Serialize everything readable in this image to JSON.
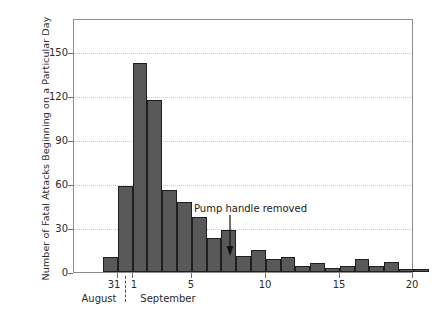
{
  "chart_data": {
    "type": "bar",
    "title": "",
    "xlabel": "",
    "ylabel": "Number of Fatal Attacks Beginning on a Particular Day",
    "ylim": [
      0,
      160
    ],
    "yticks": [
      0,
      30,
      60,
      90,
      120,
      150
    ],
    "ytick_labels": [
      "0",
      "30",
      "60",
      "90",
      "120",
      "150"
    ],
    "xlim": [
      29,
      21
    ],
    "xticks": [
      31,
      1,
      5,
      10,
      15,
      20
    ],
    "xtick_labels": [
      "31",
      "1",
      "5",
      "10",
      "15",
      "20"
    ],
    "grid": true,
    "legend": null,
    "bar_color": "#595959",
    "bar_edge_color": "#1f1f1f",
    "categories": [
      "Aug 30",
      "Aug 31",
      "Sep 1",
      "Sep 2",
      "Sep 3",
      "Sep 4",
      "Sep 5",
      "Sep 6",
      "Sep 7",
      "Sep 8",
      "Sep 9",
      "Sep 10",
      "Sep 11",
      "Sep 12",
      "Sep 13",
      "Sep 14",
      "Sep 15",
      "Sep 16",
      "Sep 17",
      "Sep 18",
      "Sep 19",
      "Sep 20"
    ],
    "values": [
      10,
      59,
      143,
      118,
      56,
      48,
      38,
      23,
      29,
      11,
      15,
      9,
      10,
      4,
      6,
      3,
      4,
      9,
      4,
      7,
      2,
      2
    ],
    "month_labels": [
      "August",
      "September"
    ],
    "annotations": [
      {
        "text": "Pump handle removed",
        "x": "Sep 8",
        "arrow": "down"
      }
    ]
  },
  "axes": {
    "y_title": "Number of Fatal Attacks Beginning on a Particular Day",
    "y_ticks": [
      "150",
      "120",
      "90",
      "60",
      "30",
      "0"
    ],
    "x_ticks": [
      "31",
      "1",
      "5",
      "10",
      "15",
      "20"
    ],
    "month_left": "August",
    "month_right": "September"
  },
  "annotation": {
    "label": "Pump handle removed"
  }
}
